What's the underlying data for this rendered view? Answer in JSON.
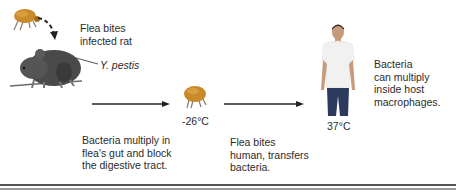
{
  "labels": {
    "flea_bites_rat": [
      "Flea bites",
      "infected rat"
    ],
    "y_pestis": "Y. pestis",
    "flea_gut": [
      "Bacteria multiply in",
      "flea's gut and block",
      "the digestive tract."
    ],
    "flea_temp": "-26°C",
    "flea_bites_human": [
      "Flea bites",
      "human, transfers",
      "bacteria."
    ],
    "human_temp": "37°C",
    "macrophages": [
      "Bacteria",
      "can multiply",
      "inside host",
      "macrophages."
    ]
  },
  "colors": {
    "flea": "#c98a2a",
    "rat": "#4a4a4a",
    "shirt": "#f2f2f2",
    "jeans": "#2c3a5e",
    "arrow": "#222222"
  }
}
